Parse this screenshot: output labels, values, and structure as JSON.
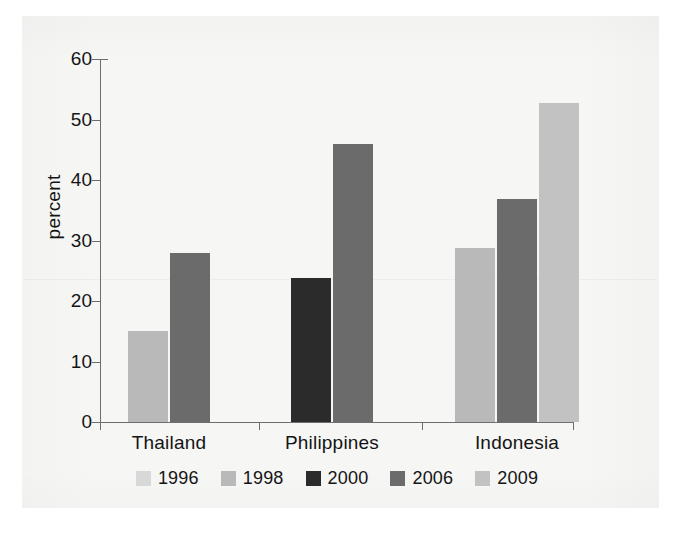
{
  "chart_data": {
    "type": "bar",
    "title": "",
    "subtitle": "",
    "xlabel": "",
    "ylabel": "percent",
    "ylim": [
      0,
      60
    ],
    "yticks": [
      "0",
      "10",
      "20",
      "30",
      "40",
      "50",
      "60"
    ],
    "grid": false,
    "legend_position": "bottom",
    "categories": [
      "Thailand",
      "Philippines",
      "Indonesia"
    ],
    "series": [
      {
        "name": "1996",
        "color": "#d8d8d8",
        "values": [
          null,
          null,
          null
        ]
      },
      {
        "name": "1998",
        "color": "#b9b9b9",
        "values": [
          15,
          null,
          28.8
        ]
      },
      {
        "name": "2000",
        "color": "#2b2b2b",
        "values": [
          null,
          23.8,
          null
        ]
      },
      {
        "name": "2006",
        "color": "#6b6b6b",
        "values": [
          28,
          46,
          36.9
        ]
      },
      {
        "name": "2009",
        "color": "#c2c2c2",
        "values": [
          null,
          null,
          52.8
        ]
      }
    ],
    "bars": [
      {
        "category": "Thailand",
        "series": "1998",
        "value": 15,
        "color": "#b9b9b9",
        "x": 128,
        "width": 40
      },
      {
        "category": "Thailand",
        "series": "2006",
        "value": 28,
        "color": "#6b6b6b",
        "x": 170,
        "width": 40
      },
      {
        "category": "Philippines",
        "series": "2000",
        "value": 23.8,
        "color": "#2b2b2b",
        "x": 291,
        "width": 40
      },
      {
        "category": "Philippines",
        "series": "2006",
        "value": 46,
        "color": "#6b6b6b",
        "x": 333,
        "width": 40
      },
      {
        "category": "Indonesia",
        "series": "1998",
        "value": 28.8,
        "color": "#b9b9b9",
        "x": 455,
        "width": 40
      },
      {
        "category": "Indonesia",
        "series": "2006",
        "value": 36.9,
        "color": "#6b6b6b",
        "x": 497,
        "width": 40
      },
      {
        "category": "Indonesia",
        "series": "2009",
        "value": 52.8,
        "color": "#c2c2c2",
        "x": 539,
        "width": 40
      }
    ],
    "category_centers": [
      169,
      332,
      517
    ],
    "xtick_positions": [
      100,
      259,
      422,
      573
    ]
  },
  "colors": {
    "background": "#ffffff",
    "panel": "#f6f6f5",
    "axis": "#6e6e6e",
    "text": "#141414"
  }
}
